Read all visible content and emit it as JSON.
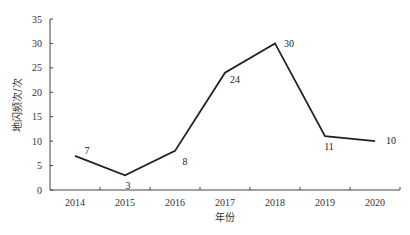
{
  "chart_data": {
    "type": "line",
    "title": "",
    "xlabel": "年份",
    "ylabel": "地闪频次/次",
    "categories": [
      "2014",
      "2015",
      "2016",
      "2017",
      "2018",
      "2019",
      "2020"
    ],
    "series": [
      {
        "name": "地闪频次",
        "values": [
          7,
          3,
          8,
          24,
          30,
          11,
          10
        ]
      }
    ],
    "data_labels": [
      "7",
      "3",
      "8",
      "24",
      "30",
      "11",
      "10"
    ],
    "yticks": [
      "0",
      "5",
      "10",
      "15",
      "20",
      "25",
      "30",
      "35"
    ],
    "ylim": [
      0,
      35
    ],
    "grid": false,
    "legend": "none",
    "line_color": "#222222"
  }
}
